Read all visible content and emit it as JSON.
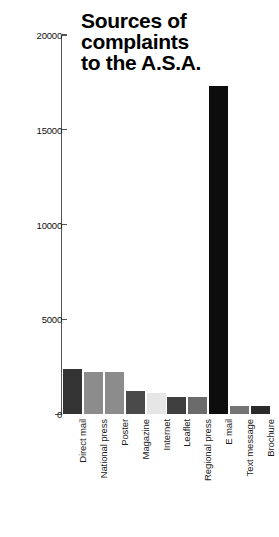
{
  "chart_data": {
    "type": "bar",
    "title": "Sources of\ncomplaints\nto the A.S.A.",
    "xlabel": "",
    "ylabel": "",
    "ylim": [
      0,
      20000
    ],
    "grid": false,
    "legend": "none",
    "y_ticks": [
      0,
      5000,
      10000,
      15000,
      20000
    ],
    "y_tick_labels": [
      "0",
      "5000",
      "10000",
      "15000",
      "20000"
    ],
    "categories": [
      "Direct mail",
      "National press",
      "Poster",
      "Magazine",
      "Internet",
      "Leaflet",
      "Regional press",
      "E mail",
      "Text message",
      "Brochure"
    ],
    "values": [
      2400,
      2200,
      2200,
      1200,
      1100,
      900,
      900,
      17300,
      420,
      400
    ],
    "bar_colors": [
      "#333333",
      "#8c8c8c",
      "#8c8c8c",
      "#4a4a4a",
      "#e6e6e6",
      "#3f3f3f",
      "#6b6b6b",
      "#0d0d0d",
      "#757575",
      "#2b2b2b"
    ]
  },
  "axis": {
    "line_color": "#555555"
  }
}
